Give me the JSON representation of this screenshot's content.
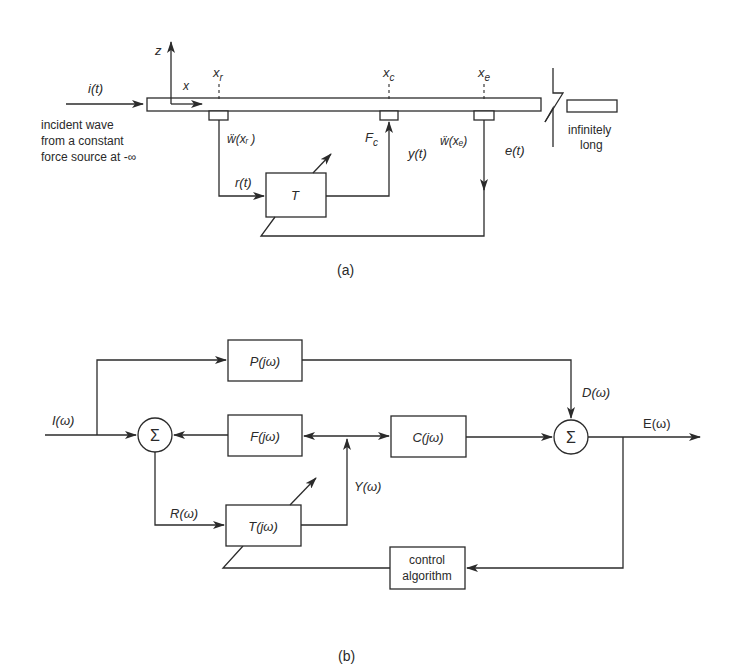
{
  "panel_a": {
    "caption": "(a)",
    "axis_z": "z",
    "axis_x": "x",
    "input_signal": "i(t)",
    "incident_note": [
      "incident wave",
      "from a constant",
      "force source at -∞"
    ],
    "positions": {
      "xr_main": "x",
      "xr_sub": "r",
      "xc_main": "x",
      "xc_sub": "c",
      "xe_main": "x",
      "xe_sub": "e"
    },
    "sensor_r_label": "ẅ(xᵣ )",
    "sensor_e_label": "ẅ(xₑ)",
    "actuator_label_main": "F",
    "actuator_label_sub": "c",
    "reference_signal": "r(t)",
    "output_signal": "y(t)",
    "error_signal": "e(t)",
    "filter_block": "T",
    "beam_note": [
      "infinitely",
      "long"
    ]
  },
  "panel_b": {
    "caption": "(b)",
    "input": "I(ω)",
    "blocks": {
      "primary": "P(jω)",
      "feedback": "F(jω)",
      "secondary": "C(jω)",
      "filter": "T(jω)",
      "control": [
        "control",
        "algorithm"
      ]
    },
    "signals": {
      "disturbance": "D(ω)",
      "error": "E(ω)",
      "reference": "R(ω)",
      "output": "Y(ω)"
    },
    "sum_symbol": "Σ"
  }
}
